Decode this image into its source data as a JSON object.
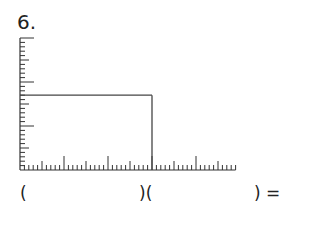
{
  "problem": {
    "number_label": "6.",
    "ruler": {
      "x_units": 49,
      "y_units": 30,
      "minor_every": 1,
      "medium_every": 5,
      "major_every": 10
    },
    "rectangle": {
      "width_units": 30,
      "height_units": 17
    },
    "equation": {
      "open1": "(",
      "middle": ")(",
      "close": ") ="
    }
  },
  "colors": {
    "ink": "#333333",
    "rect": "#444444"
  }
}
